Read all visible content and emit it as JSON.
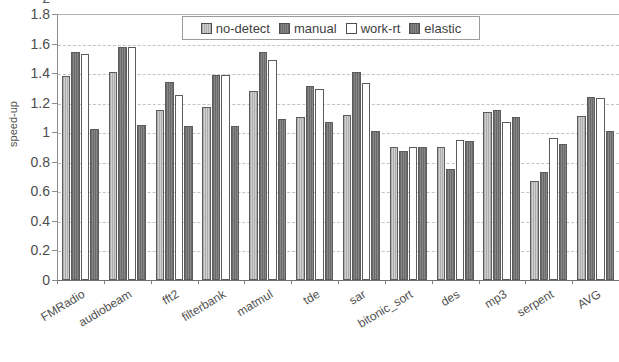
{
  "axis": {
    "ylabel": "speed-up",
    "yticks": [
      "1.8",
      "1.6",
      "1.4",
      "1.2",
      "1",
      "0.8",
      "0.6",
      "0.4",
      "0.2",
      "0"
    ],
    "ytop_clipped": "2"
  },
  "legend": {
    "items": [
      {
        "label": "no-detect",
        "style": "light-hatch",
        "color": "#c0c0c0"
      },
      {
        "label": "manual",
        "style": "dark-hatch",
        "color": "#757575"
      },
      {
        "label": "work-rt",
        "style": "white",
        "color": "#ffffff"
      },
      {
        "label": "elastic",
        "style": "dark-hatch",
        "color": "#757575"
      }
    ]
  },
  "chart_data": {
    "type": "bar",
    "title": "",
    "xlabel": "",
    "ylabel": "speed-up",
    "ylim": [
      0,
      1.8
    ],
    "ytick_step": 0.2,
    "grid": true,
    "legend_position": "top-center",
    "categories": [
      "FMRadio",
      "audiobeam",
      "fft2",
      "filterbank",
      "matmul",
      "tde",
      "sar",
      "bitonic_sort",
      "des",
      "mp3",
      "serpent",
      "AVG"
    ],
    "series": [
      {
        "name": "no-detect",
        "values": [
          1.38,
          1.41,
          1.15,
          1.17,
          1.28,
          1.1,
          1.12,
          0.9,
          0.9,
          1.14,
          0.67,
          1.11
        ]
      },
      {
        "name": "manual",
        "values": [
          1.54,
          1.58,
          1.34,
          1.39,
          1.54,
          1.31,
          1.41,
          0.87,
          0.75,
          1.15,
          0.73,
          1.24
        ]
      },
      {
        "name": "work-rt",
        "values": [
          1.53,
          1.58,
          1.25,
          1.39,
          1.49,
          1.29,
          1.33,
          0.9,
          0.95,
          1.07,
          0.96,
          1.23
        ]
      },
      {
        "name": "elastic",
        "values": [
          1.02,
          1.05,
          1.04,
          1.04,
          1.09,
          1.07,
          1.01,
          0.9,
          0.94,
          1.1,
          0.92,
          1.01
        ]
      }
    ]
  }
}
